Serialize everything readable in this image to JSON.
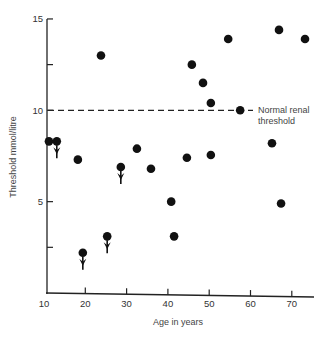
{
  "chart_data": {
    "type": "scatter",
    "title": "",
    "xlabel": "Age in years",
    "ylabel": "Threshold mmol/litre",
    "xlim": [
      10,
      75
    ],
    "ylim": [
      0,
      15
    ],
    "x_ticks": [
      10,
      20,
      30,
      40,
      50,
      60,
      70
    ],
    "y_ticks": [
      5,
      10,
      15
    ],
    "y_minor_ticks": [
      2.5,
      12.5
    ],
    "grid": false,
    "legend": null,
    "reference_line": {
      "y": 10,
      "style": "dashed",
      "label_line1": "Normal renal",
      "label_line2": "threshold"
    },
    "points": [
      {
        "x": 11.2,
        "y": 8.3,
        "arrow_down": false
      },
      {
        "x": 13.1,
        "y": 8.3,
        "arrow_down": true
      },
      {
        "x": 18.2,
        "y": 7.3,
        "arrow_down": false
      },
      {
        "x": 19.4,
        "y": 2.2,
        "arrow_down": true
      },
      {
        "x": 23.8,
        "y": 13.0,
        "arrow_down": false
      },
      {
        "x": 25.3,
        "y": 3.1,
        "arrow_down": true
      },
      {
        "x": 28.6,
        "y": 6.9,
        "arrow_down": true
      },
      {
        "x": 32.5,
        "y": 7.9,
        "arrow_down": false
      },
      {
        "x": 35.9,
        "y": 6.8,
        "arrow_down": false
      },
      {
        "x": 40.8,
        "y": 5.0,
        "arrow_down": false
      },
      {
        "x": 41.5,
        "y": 3.1,
        "arrow_down": false
      },
      {
        "x": 44.6,
        "y": 7.4,
        "arrow_down": false
      },
      {
        "x": 45.8,
        "y": 12.5,
        "arrow_down": false
      },
      {
        "x": 48.5,
        "y": 11.5,
        "arrow_down": false
      },
      {
        "x": 50.4,
        "y": 10.4,
        "arrow_down": false
      },
      {
        "x": 50.4,
        "y": 7.55,
        "arrow_down": false
      },
      {
        "x": 54.6,
        "y": 13.9,
        "arrow_down": false
      },
      {
        "x": 57.5,
        "y": 10.0,
        "arrow_down": false
      },
      {
        "x": 65.2,
        "y": 8.2,
        "arrow_down": false
      },
      {
        "x": 66.9,
        "y": 14.4,
        "arrow_down": false
      },
      {
        "x": 67.4,
        "y": 4.9,
        "arrow_down": false
      },
      {
        "x": 73.2,
        "y": 13.9,
        "arrow_down": false
      }
    ]
  }
}
